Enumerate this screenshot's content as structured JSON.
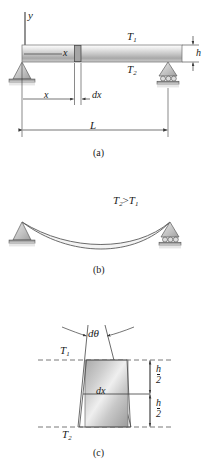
{
  "figure": {
    "title_parts": [
      "(a)",
      "(b)",
      "(c)"
    ],
    "panel_a": {
      "caption": "(a)",
      "axis_label_y": "y",
      "beam_label_x_inside": "x",
      "temp_top": "T",
      "temp_top_sub": "1",
      "temp_bottom": "T",
      "temp_bottom_sub": "2",
      "height_label": "h",
      "dim_x": "x",
      "dim_dx": "dx",
      "dim_length": "L",
      "support_left": "pin-support",
      "support_right": "roller-support"
    },
    "panel_b": {
      "caption": "(b)",
      "condition": "T",
      "condition_sub_left": "2",
      "condition_operator": ">",
      "condition_right": "T",
      "condition_sub_right": "1",
      "support_left": "pin-support",
      "support_right": "roller-support"
    },
    "panel_c": {
      "caption": "(c)",
      "angle_label": "dθ",
      "temp_top": "T",
      "temp_top_sub": "1",
      "temp_bottom": "T",
      "temp_bottom_sub": "2",
      "element_label": "dx",
      "dim_upper_num": "h",
      "dim_upper_den": "2",
      "dim_lower_num": "h",
      "dim_lower_den": "2"
    }
  },
  "colors": {
    "line": "#3a3a3a",
    "beam_light": "#f2f2f2",
    "beam_mid": "#b9b9b9",
    "beam_dark": "#8f8f8f",
    "support_fill": "#c9c9c9",
    "ground": "#6b6b6b",
    "dashed": "#555555"
  }
}
